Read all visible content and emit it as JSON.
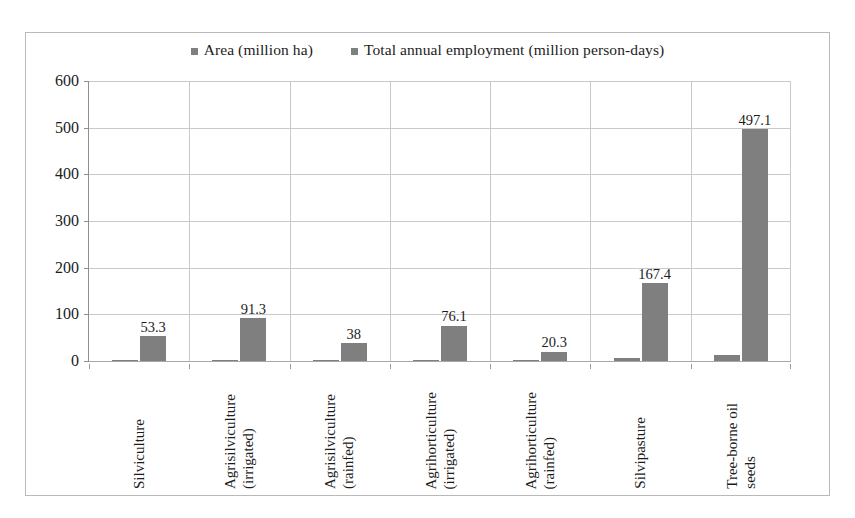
{
  "chart_data": {
    "type": "bar",
    "title": "",
    "xlabel": "",
    "ylabel": "",
    "ylim": [
      0,
      600
    ],
    "ytick_step": 100,
    "yticks": [
      "600",
      "500",
      "400",
      "300",
      "200",
      "100",
      "0"
    ],
    "grid": true,
    "legend_position": "top-center",
    "categories": [
      "Silviculture",
      "Agrisilviculture\n(irrigated)",
      "Agrisilviculture\n(rainfed)",
      "Agrihorticulture\n(irrigated)",
      "Agrihorticulture\n(rainfed)",
      "Silvipasture",
      "Tree-borne oil\nseeds"
    ],
    "series": [
      {
        "name": "Area (million ha)",
        "color": "#7f7f7f",
        "values": [
          1.8,
          2.3,
          1.3,
          1.5,
          0.5,
          5.6,
          12.4
        ],
        "labels": [
          "1.8",
          "2.3",
          "1.3",
          "1.5",
          "0.5",
          "5.6",
          "12.4"
        ]
      },
      {
        "name": "Total annual employment (million person-days)",
        "color": "#7f7f7f",
        "values": [
          53.3,
          91.3,
          38,
          76.1,
          20.3,
          167.4,
          497.1
        ],
        "labels": [
          "53.3",
          "91.3",
          "38",
          "76.1",
          "20.3",
          "167.4",
          "497.1"
        ]
      }
    ]
  },
  "legend": {
    "items": [
      {
        "label": "Area (million ha)",
        "color": "#7f7f7f"
      },
      {
        "label": "Total annual employment (million person-days)",
        "color": "#7f7f7f"
      }
    ]
  }
}
